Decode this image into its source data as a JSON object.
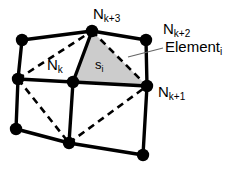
{
  "figure": {
    "type": "finite-element-mesh-diagram",
    "background_color": "#ffffff",
    "line_color": "#000000",
    "shaded_triangle_fill": "#cccccc",
    "labels": {
      "node_k_plus_3": {
        "base": "N",
        "sub": "k+3"
      },
      "node_k_plus_2": {
        "base": "N",
        "sub": "k+2"
      },
      "node_k_plus_1": {
        "base": "N",
        "sub": "k+1"
      },
      "node_k": {
        "base": "N",
        "sub": "k"
      },
      "element_i": {
        "base": "Element",
        "sub": "i"
      },
      "area_s_i": {
        "base": "s",
        "sub": "i"
      }
    },
    "nodes": [
      {
        "id": "top-left",
        "x": 22,
        "y": 40
      },
      {
        "id": "top-mid",
        "x": 92,
        "y": 31
      },
      {
        "id": "top-right",
        "x": 146,
        "y": 40
      },
      {
        "id": "mid-left",
        "x": 18,
        "y": 79
      },
      {
        "id": "mid-center",
        "x": 73,
        "y": 82
      },
      {
        "id": "mid-right",
        "x": 147,
        "y": 86
      },
      {
        "id": "bottom-left",
        "x": 16,
        "y": 129
      },
      {
        "id": "bottom-mid",
        "x": 69,
        "y": 143
      },
      {
        "id": "bottom-right",
        "x": 143,
        "y": 155
      }
    ],
    "solid_edges": [
      {
        "from": "top-left",
        "to": "top-mid"
      },
      {
        "from": "top-mid",
        "to": "top-right"
      },
      {
        "from": "mid-left",
        "to": "mid-center"
      },
      {
        "from": "mid-center",
        "to": "mid-right"
      },
      {
        "from": "bottom-left",
        "to": "bottom-mid"
      },
      {
        "from": "bottom-mid",
        "to": "bottom-right"
      },
      {
        "from": "top-left",
        "to": "mid-left"
      },
      {
        "from": "mid-left",
        "to": "bottom-left"
      },
      {
        "from": "top-mid",
        "to": "mid-center"
      },
      {
        "from": "mid-center",
        "to": "bottom-mid"
      },
      {
        "from": "top-right",
        "to": "mid-right"
      },
      {
        "from": "mid-right",
        "to": "bottom-right"
      }
    ],
    "dashed_edges": [
      {
        "from": "mid-left",
        "to": "top-mid"
      },
      {
        "from": "top-mid",
        "to": "mid-right"
      },
      {
        "from": "mid-left",
        "to": "bottom-mid"
      },
      {
        "from": "bottom-mid",
        "to": "mid-right"
      }
    ],
    "shaded_triangle": [
      "top-mid",
      "mid-center",
      "mid-right"
    ],
    "leader_line": {
      "x1": 128,
      "y1": 57,
      "x2": 162,
      "y2": 49
    }
  }
}
